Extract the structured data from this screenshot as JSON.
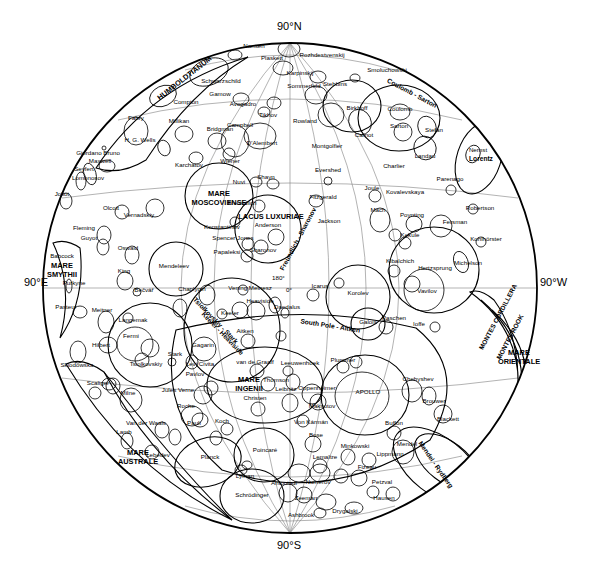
{
  "map": {
    "title": "Lunar Far Side Map",
    "projection": "orthographic-farside",
    "center_longitude_label": "180°",
    "center_longitude_label2": "0°",
    "edge_labels": {
      "north": "90°N",
      "south": "90°S",
      "east": "90°E",
      "west": "90°W"
    },
    "colors": {
      "background": "#ffffff",
      "ink": "#000000",
      "grid": "#808080"
    }
  },
  "maria": [
    {
      "name": "MARE MOSCOVIENSE",
      "line1": "MARE",
      "line2": "MOSCOVIENSE",
      "x": 219,
      "y": 196
    },
    {
      "name": "MARE INGENII",
      "line1": "MARE",
      "line2": "INGENII",
      "x": 249,
      "y": 382
    },
    {
      "name": "MARE AUSTRALE",
      "line1": "MARE",
      "line2": "AUSTRALE",
      "x": 138,
      "y": 455
    },
    {
      "name": "MARE SMYTHII",
      "line1": "MARE",
      "line2": "SMYTHII",
      "x": 62,
      "y": 268
    },
    {
      "name": "MARE ORIENTALE",
      "line1": "MARE",
      "line2": "ORIENTALE",
      "x": 519,
      "y": 355
    },
    {
      "name": "MARE HUMBOLDTIANUM",
      "line1": "HUMBOLDTIANUM",
      "x": 186,
      "y": 80
    },
    {
      "name": "LACUS LUXURIAE",
      "line1": "LACUS LUXURIAE",
      "x": 271,
      "y": 219
    }
  ],
  "basins": [
    {
      "name": "South Pole - Aitken",
      "x": 330,
      "y": 328
    },
    {
      "name": "Coulomb - Sarton",
      "x": 411,
      "y": 95
    },
    {
      "name": "Tsiolkovskiy - Stark",
      "x": 214,
      "y": 322
    },
    {
      "name": "Keeler - Heaviside",
      "x": 221,
      "y": 335
    },
    {
      "name": "Mendel - Rydberg",
      "x": 434,
      "y": 466
    },
    {
      "name": "Freundlich - Sharonov",
      "x": 300,
      "y": 240
    },
    {
      "name": "Lorentz",
      "x": 481,
      "y": 161
    }
  ],
  "montes": [
    {
      "name": "MONTES CORDILLERA",
      "x": 500,
      "y": 318
    },
    {
      "name": "MONTES ROOK",
      "x": 512,
      "y": 338
    }
  ],
  "craters": [
    {
      "name": "Nansen",
      "x": 254,
      "y": 48
    },
    {
      "name": "Rozhdestvenskij",
      "x": 322,
      "y": 57
    },
    {
      "name": "Plaskett",
      "x": 272,
      "y": 60
    },
    {
      "name": "Karpinskij",
      "x": 300,
      "y": 75
    },
    {
      "name": "Stebbins",
      "x": 335,
      "y": 86
    },
    {
      "name": "Smoluchowski",
      "x": 387,
      "y": 72
    },
    {
      "name": "Schwarzschild",
      "x": 221,
      "y": 83
    },
    {
      "name": "Sommerfeld",
      "x": 304,
      "y": 88
    },
    {
      "name": "Gamow",
      "x": 220,
      "y": 96
    },
    {
      "name": "Compton",
      "x": 186,
      "y": 104
    },
    {
      "name": "Avogadro",
      "x": 243,
      "y": 106
    },
    {
      "name": "Tikhov",
      "x": 268,
      "y": 117
    },
    {
      "name": "Birkhoff",
      "x": 357,
      "y": 110
    },
    {
      "name": "Coulomb",
      "x": 400,
      "y": 111
    },
    {
      "name": "Sarton",
      "x": 399,
      "y": 128
    },
    {
      "name": "Stefan",
      "x": 434,
      "y": 132
    },
    {
      "name": "Nernst",
      "x": 478,
      "y": 152
    },
    {
      "name": "Fabry",
      "x": 136,
      "y": 120
    },
    {
      "name": "Millikan",
      "x": 179,
      "y": 123
    },
    {
      "name": "Bridgman",
      "x": 220,
      "y": 131
    },
    {
      "name": "Campbell",
      "x": 240,
      "y": 127
    },
    {
      "name": "Rowland",
      "x": 305,
      "y": 123
    },
    {
      "name": "Carnot",
      "x": 364,
      "y": 137
    },
    {
      "name": "Landau",
      "x": 425,
      "y": 158
    },
    {
      "name": "H. G. Wells",
      "x": 140,
      "y": 142
    },
    {
      "name": "D'Alembert",
      "x": 262,
      "y": 145
    },
    {
      "name": "Montgolfier",
      "x": 327,
      "y": 148
    },
    {
      "name": "Charlier",
      "x": 394,
      "y": 168
    },
    {
      "name": "Parenago",
      "x": 450,
      "y": 181
    },
    {
      "name": "Giordano Bruno",
      "x": 98,
      "y": 155
    },
    {
      "name": "Maxwell",
      "x": 100,
      "y": 163
    },
    {
      "name": "Karchatov",
      "x": 189,
      "y": 167
    },
    {
      "name": "Wiener",
      "x": 230,
      "y": 163
    },
    {
      "name": "Evershed",
      "x": 328,
      "y": 172
    },
    {
      "name": "Seyfert",
      "x": 84,
      "y": 171
    },
    {
      "name": "Lomonosov",
      "x": 88,
      "y": 180
    },
    {
      "name": "Shayn",
      "x": 266,
      "y": 179
    },
    {
      "name": "Nuvi",
      "x": 239,
      "y": 184
    },
    {
      "name": "Joule",
      "x": 372,
      "y": 190
    },
    {
      "name": "Kovalevskaya",
      "x": 405,
      "y": 194
    },
    {
      "name": "Robertson",
      "x": 480,
      "y": 210
    },
    {
      "name": "Joliot",
      "x": 62,
      "y": 196
    },
    {
      "name": "Fitzgerald",
      "x": 323,
      "y": 199
    },
    {
      "name": "Poynting",
      "x": 412,
      "y": 217
    },
    {
      "name": "Olcott",
      "x": 111,
      "y": 210
    },
    {
      "name": "Vernadskiy",
      "x": 139,
      "y": 217
    },
    {
      "name": "Freundlich",
      "x": 242,
      "y": 205
    },
    {
      "name": "Mach",
      "x": 378,
      "y": 212
    },
    {
      "name": "Fersman",
      "x": 455,
      "y": 224
    },
    {
      "name": "Jackson",
      "x": 329,
      "y": 223
    },
    {
      "name": "Anderson",
      "x": 268,
      "y": 227
    },
    {
      "name": "Fleming",
      "x": 84,
      "y": 230
    },
    {
      "name": "Konstantinov",
      "x": 222,
      "y": 229
    },
    {
      "name": "Kekule",
      "x": 410,
      "y": 237
    },
    {
      "name": "Kohlhörster",
      "x": 486,
      "y": 241
    },
    {
      "name": "Guyot",
      "x": 89,
      "y": 240
    },
    {
      "name": "Spencer Jones",
      "x": 233,
      "y": 240
    },
    {
      "name": "Oswald",
      "x": 128,
      "y": 250
    },
    {
      "name": "Sharonov",
      "x": 263,
      "y": 252
    },
    {
      "name": "Papaleksi",
      "x": 227,
      "y": 254
    },
    {
      "name": "Michelson",
      "x": 468,
      "y": 265
    },
    {
      "name": "Kibalchich",
      "x": 400,
      "y": 263
    },
    {
      "name": "Hertzsprung",
      "x": 435,
      "y": 270
    },
    {
      "name": "Babcock",
      "x": 62,
      "y": 258
    },
    {
      "name": "Mendeleev",
      "x": 174,
      "y": 268
    },
    {
      "name": "King",
      "x": 124,
      "y": 273
    },
    {
      "name": "Purkyne",
      "x": 74,
      "y": 285
    },
    {
      "name": "Beĉvář",
      "x": 144,
      "y": 292
    },
    {
      "name": "Chaplygin",
      "x": 192,
      "y": 291
    },
    {
      "name": "Vening Meinesz",
      "x": 250,
      "y": 290
    },
    {
      "name": "Korolev",
      "x": 358,
      "y": 295
    },
    {
      "name": "Vavilov",
      "x": 427,
      "y": 293
    },
    {
      "name": "Icarus",
      "x": 320,
      "y": 288
    },
    {
      "name": "Heaviside",
      "x": 260,
      "y": 303
    },
    {
      "name": "Daedalus",
      "x": 287,
      "y": 309
    },
    {
      "name": "Pasteur",
      "x": 66,
      "y": 309
    },
    {
      "name": "Meitner",
      "x": 102,
      "y": 312
    },
    {
      "name": "Langemak",
      "x": 133,
      "y": 322
    },
    {
      "name": "Keeler",
      "x": 230,
      "y": 315
    },
    {
      "name": "Paschen",
      "x": 394,
      "y": 320
    },
    {
      "name": "Galois",
      "x": 368,
      "y": 324
    },
    {
      "name": "Ioffe",
      "x": 419,
      "y": 326
    },
    {
      "name": "Hilbert",
      "x": 101,
      "y": 347
    },
    {
      "name": "Fermi",
      "x": 131,
      "y": 338
    },
    {
      "name": "Aitken",
      "x": 245,
      "y": 333
    },
    {
      "name": "Gagarin",
      "x": 203,
      "y": 347
    },
    {
      "name": "Stark",
      "x": 175,
      "y": 356
    },
    {
      "name": "Tsiolkovskiy",
      "x": 146,
      "y": 366
    },
    {
      "name": "Sklodowska",
      "x": 77,
      "y": 367
    },
    {
      "name": "Levi Civita",
      "x": 200,
      "y": 366
    },
    {
      "name": "van de Graaff",
      "x": 255,
      "y": 364
    },
    {
      "name": "Leeuwenhoek",
      "x": 300,
      "y": 365
    },
    {
      "name": "Plummer",
      "x": 343,
      "y": 362
    },
    {
      "name": "Pavlov",
      "x": 195,
      "y": 376
    },
    {
      "name": "Scaliger",
      "x": 98,
      "y": 385
    },
    {
      "name": "Thomson",
      "x": 276,
      "y": 382
    },
    {
      "name": "Milne",
      "x": 128,
      "y": 395
    },
    {
      "name": "Jules Verne",
      "x": 178,
      "y": 392
    },
    {
      "name": "Oppenheimer",
      "x": 317,
      "y": 390
    },
    {
      "name": "APOLLO",
      "x": 368,
      "y": 394
    },
    {
      "name": "Chebyshev",
      "x": 418,
      "y": 381
    },
    {
      "name": "Leibnitz",
      "x": 286,
      "y": 391
    },
    {
      "name": "Roche",
      "x": 186,
      "y": 408
    },
    {
      "name": "Maksutov",
      "x": 322,
      "y": 408
    },
    {
      "name": "Brouwer",
      "x": 434,
      "y": 403
    },
    {
      "name": "Christen",
      "x": 255,
      "y": 400
    },
    {
      "name": "Van der Waals",
      "x": 146,
      "y": 425
    },
    {
      "name": "Koch",
      "x": 222,
      "y": 423
    },
    {
      "name": "Pauli",
      "x": 194,
      "y": 425
    },
    {
      "name": "Von Kármán",
      "x": 311,
      "y": 424
    },
    {
      "name": "Blackett",
      "x": 448,
      "y": 421
    },
    {
      "name": "Lamb",
      "x": 124,
      "y": 434
    },
    {
      "name": "Buffon",
      "x": 394,
      "y": 425
    },
    {
      "name": "Bose",
      "x": 316,
      "y": 437
    },
    {
      "name": "Lebedev",
      "x": 158,
      "y": 457
    },
    {
      "name": "Planck",
      "x": 210,
      "y": 459
    },
    {
      "name": "Poincaré",
      "x": 265,
      "y": 452
    },
    {
      "name": "Minkowski",
      "x": 355,
      "y": 448
    },
    {
      "name": "Mendel",
      "x": 407,
      "y": 446
    },
    {
      "name": "Lemaître",
      "x": 325,
      "y": 459
    },
    {
      "name": "Lippmann",
      "x": 390,
      "y": 456
    },
    {
      "name": "Lyman",
      "x": 245,
      "y": 478
    },
    {
      "name": "Fizeau",
      "x": 367,
      "y": 469
    },
    {
      "name": "Antoniadi",
      "x": 284,
      "y": 485
    },
    {
      "name": "Numerov",
      "x": 318,
      "y": 484
    },
    {
      "name": "Petzval",
      "x": 382,
      "y": 484
    },
    {
      "name": "Schrödinger",
      "x": 252,
      "y": 497
    },
    {
      "name": "Zeeman",
      "x": 306,
      "y": 500
    },
    {
      "name": "Hausen",
      "x": 384,
      "y": 500
    },
    {
      "name": "Ashbrook",
      "x": 301,
      "y": 517
    },
    {
      "name": "Drygalski",
      "x": 345,
      "y": 513
    }
  ]
}
